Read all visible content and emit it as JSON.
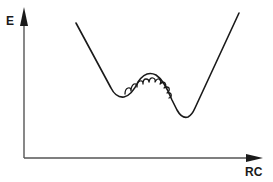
{
  "diagram": {
    "title": "",
    "type": "potential-energy-profile",
    "y_axis": {
      "label": "E"
    },
    "x_axis": {
      "label": "RC"
    },
    "curve": {
      "description": "double-well energy curve with two minima separated by a barrier",
      "features": [
        "left-minimum",
        "barrier",
        "right-minimum"
      ],
      "barrier_decoration": "wavy-fluctuation-overlay"
    },
    "colors": {
      "line": "#1a1a1a",
      "axis": "#555555",
      "background": "#ffffff"
    }
  }
}
